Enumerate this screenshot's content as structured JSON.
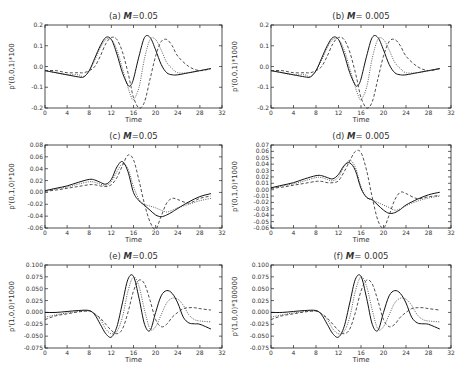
{
  "figure": {
    "series_styles": [
      "solid",
      "dashed",
      "dotted"
    ]
  },
  "chart_data": [
    {
      "type": "line",
      "id": "a",
      "title": "(a) M=0.05",
      "title_prefix": "(a)",
      "title_var": "M",
      "title_val": "=0.05",
      "xlabel": "Time",
      "ylabel": "p'(0,0,1)*100",
      "xlim": [
        0,
        32
      ],
      "ylim": [
        -0.2,
        0.2
      ],
      "xticks": [
        0,
        4,
        8,
        12,
        16,
        20,
        24,
        28,
        32
      ],
      "yticks": [
        -0.2,
        -0.1,
        0.0,
        0.1,
        0.2
      ],
      "ytick_labels": [
        "-0.2",
        "-0.1",
        "0.0",
        "0.1",
        "0.2"
      ],
      "x": [
        0,
        2,
        4,
        6,
        7,
        8,
        9,
        10,
        11,
        12,
        13,
        14,
        15,
        15.5,
        16,
        17,
        18,
        19,
        20,
        21,
        22,
        23,
        24,
        26,
        28,
        30
      ],
      "series": [
        {
          "name": "solid",
          "values": [
            -0.02,
            -0.03,
            -0.04,
            -0.05,
            -0.05,
            -0.02,
            0.04,
            0.1,
            0.14,
            0.13,
            0.06,
            -0.03,
            -0.09,
            -0.09,
            -0.06,
            0.05,
            0.14,
            0.14,
            0.08,
            0.01,
            -0.03,
            -0.04,
            -0.04,
            -0.03,
            -0.02,
            -0.01
          ]
        },
        {
          "name": "dashed",
          "values": [
            -0.02,
            -0.02,
            -0.03,
            -0.03,
            -0.03,
            -0.02,
            0.0,
            0.05,
            0.11,
            0.14,
            0.13,
            0.07,
            -0.03,
            -0.09,
            -0.15,
            -0.2,
            -0.17,
            -0.06,
            0.05,
            0.12,
            0.13,
            0.1,
            0.05,
            0.0,
            -0.02,
            -0.01
          ]
        },
        {
          "name": "dotted",
          "values": [
            -0.02,
            -0.03,
            -0.04,
            -0.04,
            -0.05,
            -0.02,
            0.03,
            0.09,
            0.13,
            0.13,
            0.08,
            -0.01,
            -0.1,
            -0.14,
            -0.16,
            -0.1,
            0.04,
            0.13,
            0.13,
            0.08,
            0.02,
            -0.01,
            -0.03,
            -0.03,
            -0.02,
            -0.01
          ]
        }
      ]
    },
    {
      "type": "line",
      "id": "b",
      "title": "(b) M = 0.005",
      "title_prefix": "(b)",
      "title_var": "M",
      "title_val": "= 0.005",
      "xlabel": "Time",
      "ylabel": "p'(0,0,1)*1000",
      "xlim": [
        0,
        32
      ],
      "ylim": [
        -0.2,
        0.2
      ],
      "xticks": [
        0,
        4,
        8,
        12,
        16,
        20,
        24,
        28,
        32
      ],
      "yticks": [
        -0.2,
        -0.1,
        0.0,
        0.1,
        0.2
      ],
      "ytick_labels": [
        "-0.2",
        "-0.1",
        "0.0",
        "0.1",
        "0.2"
      ],
      "x": [
        0,
        2,
        4,
        6,
        7,
        8,
        9,
        10,
        11,
        12,
        13,
        14,
        15,
        15.5,
        16,
        17,
        18,
        19,
        20,
        21,
        22,
        23,
        24,
        26,
        28,
        30
      ],
      "series": [
        {
          "name": "solid",
          "values": [
            -0.02,
            -0.03,
            -0.04,
            -0.05,
            -0.05,
            -0.02,
            0.04,
            0.1,
            0.14,
            0.13,
            0.06,
            -0.03,
            -0.09,
            -0.09,
            -0.06,
            0.05,
            0.14,
            0.14,
            0.08,
            0.01,
            -0.03,
            -0.04,
            -0.04,
            -0.03,
            -0.02,
            -0.01
          ]
        },
        {
          "name": "dashed",
          "values": [
            -0.02,
            -0.02,
            -0.03,
            -0.03,
            -0.03,
            -0.02,
            0.0,
            0.05,
            0.11,
            0.14,
            0.13,
            0.07,
            -0.03,
            -0.09,
            -0.15,
            -0.2,
            -0.17,
            -0.06,
            0.05,
            0.12,
            0.13,
            0.1,
            0.05,
            0.0,
            -0.02,
            -0.01
          ]
        },
        {
          "name": "dotted",
          "values": [
            -0.02,
            -0.03,
            -0.04,
            -0.04,
            -0.05,
            -0.02,
            0.03,
            0.09,
            0.13,
            0.13,
            0.08,
            -0.01,
            -0.1,
            -0.14,
            -0.16,
            -0.1,
            0.04,
            0.13,
            0.13,
            0.08,
            0.02,
            -0.01,
            -0.03,
            -0.03,
            -0.02,
            -0.01
          ]
        }
      ]
    },
    {
      "type": "line",
      "id": "c",
      "title": "(c) M=0.05",
      "title_prefix": "(c)",
      "title_var": "M",
      "title_val": "=0.05",
      "xlabel": "Time",
      "ylabel": "p'(0,1,0)*100",
      "xlim": [
        0,
        32
      ],
      "ylim": [
        -0.06,
        0.08
      ],
      "xticks": [
        0,
        4,
        8,
        12,
        16,
        20,
        24,
        28,
        32
      ],
      "yticks": [
        -0.06,
        -0.04,
        -0.02,
        0.0,
        0.02,
        0.04,
        0.06,
        0.08
      ],
      "ytick_labels": [
        "-0.06",
        "-0.04",
        "-0.02",
        "0.00",
        "0.02",
        "0.04",
        "0.06",
        "0.08"
      ],
      "x": [
        0,
        2,
        4,
        6,
        8,
        9,
        10,
        11,
        12,
        13,
        14,
        15,
        16,
        17,
        18,
        19,
        20,
        21,
        22,
        23,
        24,
        26,
        28,
        30
      ],
      "series": [
        {
          "name": "solid",
          "values": [
            0.003,
            0.007,
            0.011,
            0.017,
            0.022,
            0.021,
            0.017,
            0.014,
            0.022,
            0.043,
            0.052,
            0.035,
            0.0,
            -0.014,
            -0.022,
            -0.03,
            -0.038,
            -0.041,
            -0.038,
            -0.033,
            -0.027,
            -0.016,
            -0.007,
            -0.002
          ]
        },
        {
          "name": "dashed",
          "values": [
            0.002,
            0.004,
            0.007,
            0.01,
            0.013,
            0.013,
            0.011,
            0.01,
            0.013,
            0.025,
            0.045,
            0.063,
            0.055,
            0.02,
            -0.02,
            -0.05,
            -0.062,
            -0.04,
            -0.018,
            -0.01,
            -0.012,
            -0.018,
            -0.01,
            -0.006
          ]
        },
        {
          "name": "dotted",
          "values": [
            0.002,
            0.006,
            0.009,
            0.014,
            0.018,
            0.017,
            0.014,
            0.012,
            0.018,
            0.035,
            0.048,
            0.04,
            0.01,
            -0.012,
            -0.02,
            -0.023,
            -0.026,
            -0.03,
            -0.033,
            -0.03,
            -0.026,
            -0.02,
            -0.014,
            -0.01
          ]
        }
      ]
    },
    {
      "type": "line",
      "id": "d",
      "title": "(d) M = 0.005",
      "title_prefix": "(d)",
      "title_var": "M",
      "title_val": "= 0.005",
      "xlabel": "Time",
      "ylabel": "p'(0,1,0)*1000",
      "xlim": [
        0,
        32
      ],
      "ylim": [
        -0.06,
        0.07
      ],
      "xticks": [
        0,
        4,
        8,
        12,
        16,
        20,
        24,
        28,
        32
      ],
      "yticks": [
        -0.06,
        -0.05,
        -0.04,
        -0.03,
        -0.02,
        -0.01,
        0.0,
        0.01,
        0.02,
        0.03,
        0.04,
        0.05,
        0.06,
        0.07
      ],
      "ytick_labels": [
        "-0.06",
        "-0.05",
        "-0.04",
        "-0.03",
        "-0.02",
        "-0.01",
        "0.00",
        "0.01",
        "0.02",
        "0.03",
        "0.04",
        "0.05",
        "0.06",
        "0.07"
      ],
      "x": [
        0,
        2,
        4,
        6,
        8,
        9,
        10,
        11,
        12,
        13,
        14,
        15,
        16,
        17,
        18,
        19,
        20,
        21,
        22,
        23,
        24,
        26,
        28,
        30
      ],
      "series": [
        {
          "name": "solid",
          "values": [
            0.003,
            0.007,
            0.011,
            0.017,
            0.022,
            0.022,
            0.019,
            0.017,
            0.024,
            0.038,
            0.042,
            0.03,
            0.002,
            -0.012,
            -0.016,
            -0.024,
            -0.032,
            -0.037,
            -0.036,
            -0.031,
            -0.024,
            -0.015,
            -0.008,
            -0.004
          ]
        },
        {
          "name": "dashed",
          "values": [
            0.002,
            0.004,
            0.007,
            0.01,
            0.013,
            0.013,
            0.011,
            0.011,
            0.014,
            0.028,
            0.045,
            0.06,
            0.058,
            0.03,
            -0.012,
            -0.048,
            -0.06,
            -0.04,
            -0.016,
            -0.004,
            -0.006,
            -0.014,
            -0.011,
            -0.009
          ]
        },
        {
          "name": "dotted",
          "values": [
            0.002,
            0.006,
            0.009,
            0.014,
            0.019,
            0.019,
            0.016,
            0.014,
            0.02,
            0.036,
            0.046,
            0.035,
            0.005,
            -0.012,
            -0.016,
            -0.02,
            -0.024,
            -0.028,
            -0.032,
            -0.03,
            -0.025,
            -0.018,
            -0.013,
            -0.01
          ]
        }
      ]
    },
    {
      "type": "line",
      "id": "e",
      "title": "(e) M=0.05",
      "title_prefix": "(e)",
      "title_var": "M",
      "title_val": "=0.05",
      "xlabel": "Time",
      "ylabel": "p'(1,0,0)*1000",
      "xlim": [
        0,
        32
      ],
      "ylim": [
        -0.075,
        0.1
      ],
      "xticks": [
        0,
        4,
        8,
        12,
        16,
        20,
        24,
        28,
        32
      ],
      "yticks": [
        -0.075,
        -0.05,
        -0.025,
        0.0,
        0.025,
        0.05,
        0.075,
        0.1
      ],
      "ytick_labels": [
        "-0.075",
        "-0.050",
        "-0.025",
        "0.000",
        "0.025",
        "0.050",
        "0.075",
        "0.100"
      ],
      "x": [
        0,
        2,
        4,
        6,
        8,
        9,
        10,
        11,
        12,
        13,
        14,
        15,
        16,
        17,
        18,
        19,
        20,
        21,
        22,
        23,
        24,
        25,
        26,
        27,
        28,
        30
      ],
      "series": [
        {
          "name": "solid",
          "values": [
            0.0,
            0.0,
            0.002,
            0.004,
            0.004,
            -0.005,
            -0.025,
            -0.045,
            -0.052,
            -0.03,
            0.02,
            0.07,
            0.076,
            0.03,
            -0.025,
            -0.038,
            0.0,
            0.035,
            0.046,
            0.04,
            0.02,
            -0.01,
            -0.022,
            -0.024,
            -0.025,
            -0.035
          ]
        },
        {
          "name": "dashed",
          "values": [
            -0.015,
            -0.007,
            -0.003,
            0.001,
            0.003,
            -0.003,
            -0.012,
            -0.025,
            -0.038,
            -0.045,
            -0.035,
            0.0,
            0.045,
            0.068,
            0.06,
            0.025,
            -0.015,
            -0.03,
            -0.025,
            -0.01,
            0.0,
            0.008,
            0.01,
            0.01,
            0.008,
            0.005
          ]
        },
        {
          "name": "dotted",
          "values": [
            -0.01,
            -0.005,
            -0.001,
            0.002,
            0.003,
            -0.003,
            -0.015,
            -0.035,
            -0.045,
            -0.04,
            -0.01,
            0.045,
            0.075,
            0.055,
            0.005,
            -0.035,
            -0.03,
            -0.005,
            0.02,
            0.03,
            0.028,
            0.015,
            -0.005,
            -0.015,
            -0.018,
            -0.02
          ]
        }
      ]
    },
    {
      "type": "line",
      "id": "f",
      "title": "(f) M = 0.005",
      "title_prefix": "(f)",
      "title_var": "M",
      "title_val": "= 0.005",
      "xlabel": "Time",
      "ylabel": "p'(1,0,0)*100000",
      "xlim": [
        0,
        32
      ],
      "ylim": [
        -0.075,
        0.1
      ],
      "xticks": [
        0,
        4,
        8,
        12,
        16,
        20,
        24,
        28,
        32
      ],
      "yticks": [
        -0.075,
        -0.05,
        -0.025,
        0.0,
        0.025,
        0.05,
        0.075,
        0.1
      ],
      "ytick_labels": [
        "-0.075",
        "-0.050",
        "-0.025",
        "0.000",
        "0.025",
        "0.050",
        "0.075",
        "0.100"
      ],
      "x": [
        0,
        2,
        4,
        6,
        8,
        9,
        10,
        11,
        12,
        13,
        14,
        15,
        16,
        17,
        18,
        19,
        20,
        21,
        22,
        23,
        24,
        25,
        26,
        27,
        28,
        30
      ],
      "series": [
        {
          "name": "solid",
          "values": [
            0.0,
            0.0,
            0.002,
            0.004,
            0.004,
            -0.005,
            -0.025,
            -0.045,
            -0.052,
            -0.03,
            0.02,
            0.07,
            0.076,
            0.03,
            -0.025,
            -0.038,
            0.0,
            0.035,
            0.046,
            0.04,
            0.02,
            -0.01,
            -0.022,
            -0.024,
            -0.025,
            -0.035
          ]
        },
        {
          "name": "dashed",
          "values": [
            -0.015,
            -0.007,
            -0.003,
            0.001,
            0.003,
            -0.003,
            -0.012,
            -0.025,
            -0.038,
            -0.045,
            -0.035,
            0.0,
            0.045,
            0.068,
            0.06,
            0.025,
            -0.015,
            -0.03,
            -0.025,
            -0.01,
            0.0,
            0.008,
            0.01,
            0.01,
            0.008,
            0.005
          ]
        },
        {
          "name": "dotted",
          "values": [
            -0.01,
            -0.005,
            -0.001,
            0.002,
            0.003,
            -0.003,
            -0.015,
            -0.035,
            -0.045,
            -0.04,
            -0.01,
            0.045,
            0.075,
            0.055,
            0.005,
            -0.035,
            -0.03,
            -0.005,
            0.02,
            0.03,
            0.028,
            0.015,
            -0.005,
            -0.015,
            -0.018,
            -0.02
          ]
        }
      ]
    }
  ]
}
